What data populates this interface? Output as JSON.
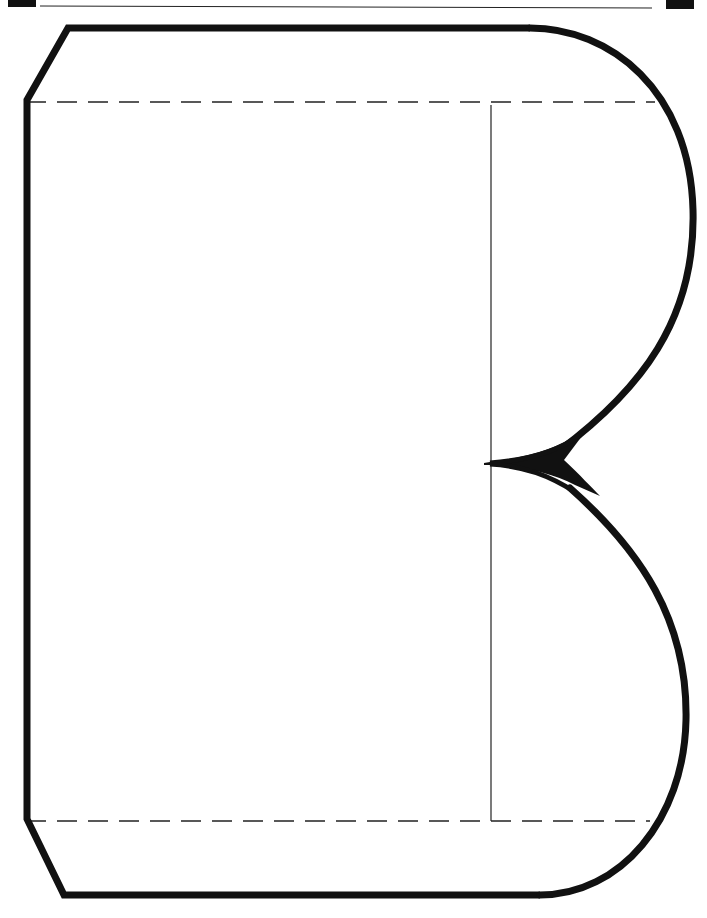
{
  "colors": {
    "outline": "#111111",
    "guide": "#222222",
    "background": "#ffffff"
  },
  "diagram": {
    "shape": "letter-B-outline",
    "guides": {
      "top_dashed_y": 102,
      "bottom_dashed_y": 821,
      "vertical_stem_x": 491
    }
  }
}
